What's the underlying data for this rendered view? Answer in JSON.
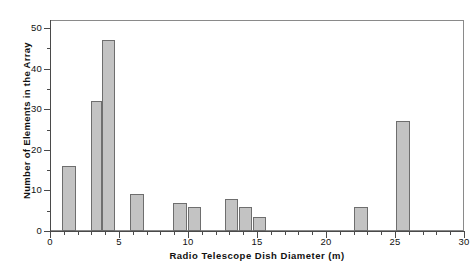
{
  "chart_data": {
    "type": "bar",
    "title": "",
    "subtitle": "",
    "xlabel": "Radio Telescope Dish Diameter (m)",
    "ylabel": "Number of Elements in the Array",
    "xlim": [
      0,
      30
    ],
    "ylim": [
      0,
      52
    ],
    "grid": false,
    "legend": null,
    "x_major_ticks": [
      0,
      5,
      10,
      15,
      20,
      25,
      30
    ],
    "x_major_tick_labels": [
      "0",
      "5",
      "10",
      "15",
      "20",
      "25",
      "30"
    ],
    "x_minor_tick_interval": 1,
    "y_major_ticks": [
      0,
      10,
      20,
      30,
      40,
      50
    ],
    "y_major_tick_labels": [
      "0",
      "10",
      "20",
      "30",
      "40",
      "50"
    ],
    "y_minor_tick_interval": 5,
    "bar_facecolor": "#c3c3c3",
    "bar_edgecolor": "#6e6e6e",
    "axis_color": "#4a4a4a",
    "frame_color": "#8a8a8a",
    "background": "#ffffff",
    "bars": [
      {
        "x_start": 0.85,
        "x_end": 1.85,
        "value": 16
      },
      {
        "x_start": 2.95,
        "x_end": 3.8,
        "value": 32
      },
      {
        "x_start": 3.8,
        "x_end": 4.7,
        "value": 47
      },
      {
        "x_start": 5.8,
        "x_end": 6.8,
        "value": 9
      },
      {
        "x_start": 8.9,
        "x_end": 9.9,
        "value": 7
      },
      {
        "x_start": 10.0,
        "x_end": 10.95,
        "value": 6
      },
      {
        "x_start": 12.65,
        "x_end": 13.65,
        "value": 8
      },
      {
        "x_start": 13.7,
        "x_end": 14.65,
        "value": 6
      },
      {
        "x_start": 14.7,
        "x_end": 15.65,
        "value": 3.5
      },
      {
        "x_start": 22.05,
        "x_end": 23.05,
        "value": 6
      },
      {
        "x_start": 25.1,
        "x_end": 26.1,
        "value": 27
      }
    ],
    "categories": [
      "1",
      "3",
      "4",
      "6",
      "9",
      "10",
      "13",
      "14",
      "15",
      "22",
      "25"
    ],
    "values": [
      16,
      32,
      47,
      9,
      7,
      6,
      8,
      6,
      3.5,
      6,
      27
    ]
  }
}
